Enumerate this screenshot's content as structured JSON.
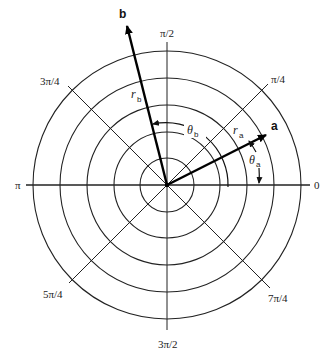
{
  "diagram": {
    "colors": {
      "line": "#222222",
      "vector": "#000000",
      "background": "#ffffff"
    },
    "center": {
      "x": 167,
      "y": 185
    },
    "ring_radii": [
      27,
      53,
      80,
      107,
      134
    ],
    "angle_labels": {
      "zero": "0",
      "pi_over_4": "π/4",
      "pi_over_2": "π/2",
      "three_pi_over_4": "3π/4",
      "pi": "π",
      "five_pi_over_4": "5π/4",
      "three_pi_over_2": "3π/2",
      "seven_pi_over_4": "7π/4"
    },
    "vectors": {
      "a": {
        "label": "a",
        "radius_symbol": "r",
        "radius_sub": "a",
        "angle_symbol": "θ",
        "angle_sub": "a",
        "angle_deg": 26,
        "length": 82
      },
      "b": {
        "label": "b",
        "radius_symbol": "r",
        "radius_sub": "b",
        "angle_symbol": "θ",
        "angle_sub": "b",
        "angle_deg": 104,
        "length": 163
      }
    }
  }
}
